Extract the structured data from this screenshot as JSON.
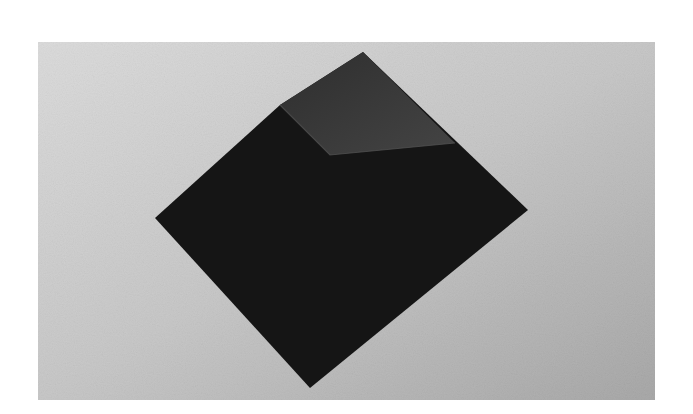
{
  "image": {
    "subject": "folded dark paper square (origami pyramid fold) on light textured surface",
    "colors": {
      "page": "#ffffff",
      "background_light": "#d9d9d9",
      "background_dark": "#a8a8a8",
      "paper_dark": "#141414",
      "paper_flap": "#3a3a3a"
    }
  }
}
